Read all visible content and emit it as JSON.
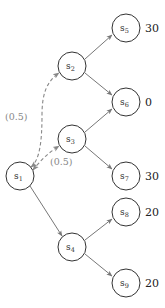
{
  "diagram": {
    "type": "decision-tree",
    "colors": {
      "node_stroke": "#333333",
      "edge": "#777777",
      "dashed_edge": "#888888",
      "prob_label": "#888888",
      "value_label": "#222222"
    },
    "nodes": [
      {
        "id": "s1",
        "base": "s",
        "sub": "1",
        "cx": 20,
        "cy": 176,
        "value": ""
      },
      {
        "id": "s2",
        "base": "s",
        "sub": "2",
        "cx": 72,
        "cy": 66,
        "value": ""
      },
      {
        "id": "s3",
        "base": "s",
        "sub": "3",
        "cx": 72,
        "cy": 139,
        "value": ""
      },
      {
        "id": "s4",
        "base": "s",
        "sub": "4",
        "cx": 72,
        "cy": 247,
        "value": ""
      },
      {
        "id": "s5",
        "base": "s",
        "sub": "5",
        "cx": 126,
        "cy": 28,
        "value": "30"
      },
      {
        "id": "s6",
        "base": "s",
        "sub": "6",
        "cx": 126,
        "cy": 102,
        "value": "0"
      },
      {
        "id": "s7",
        "base": "s",
        "sub": "7",
        "cx": 126,
        "cy": 176,
        "value": "30"
      },
      {
        "id": "s8",
        "base": "s",
        "sub": "8",
        "cx": 126,
        "cy": 212,
        "value": "20"
      },
      {
        "id": "s9",
        "base": "s",
        "sub": "9",
        "cx": 126,
        "cy": 283,
        "value": "20"
      }
    ],
    "edges": [
      {
        "from": "s1",
        "to": "s2",
        "style": "dashed",
        "bidirectional": true,
        "label": "(0.5)"
      },
      {
        "from": "s1",
        "to": "s3",
        "style": "dashed",
        "bidirectional": true,
        "label": "(0.5)"
      },
      {
        "from": "s1",
        "to": "s4",
        "style": "solid"
      },
      {
        "from": "s2",
        "to": "s5",
        "style": "solid"
      },
      {
        "from": "s2",
        "to": "s6",
        "style": "solid"
      },
      {
        "from": "s3",
        "to": "s6",
        "style": "solid"
      },
      {
        "from": "s3",
        "to": "s7",
        "style": "solid"
      },
      {
        "from": "s4",
        "to": "s8",
        "style": "solid"
      },
      {
        "from": "s4",
        "to": "s9",
        "style": "solid"
      }
    ],
    "labels": {
      "prob_s2": "(0.5)",
      "prob_s3": "(0.5)",
      "value_s5": "30",
      "value_s6": "0",
      "value_s7": "30",
      "value_s8": "20",
      "value_s9": "20",
      "s1": {
        "base": "s",
        "sub": "1"
      },
      "s2": {
        "base": "s",
        "sub": "2"
      },
      "s3": {
        "base": "s",
        "sub": "3"
      },
      "s4": {
        "base": "s",
        "sub": "4"
      },
      "s5": {
        "base": "s",
        "sub": "5"
      },
      "s6": {
        "base": "s",
        "sub": "6"
      },
      "s7": {
        "base": "s",
        "sub": "7"
      },
      "s8": {
        "base": "s",
        "sub": "8"
      },
      "s9": {
        "base": "s",
        "sub": "9"
      }
    }
  }
}
